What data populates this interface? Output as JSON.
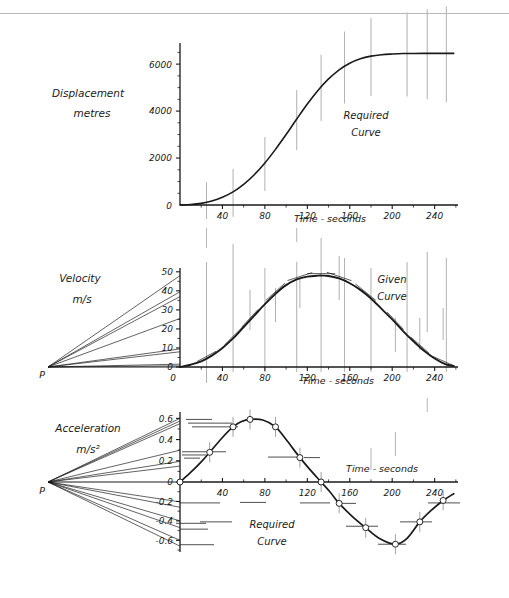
{
  "figure": {
    "background": "#ffffff",
    "ink": "#1a1a1a",
    "construction_color": "#8c8c8c",
    "top_rule": true
  },
  "panels": [
    {
      "id": "displacement",
      "y_axis_title_line1": "Displacement",
      "y_axis_title_line2": "metres",
      "x_axis_title": "Time - seconds",
      "curve_label_line1": "Required",
      "curve_label_line2": "Curve",
      "origin_label": "0",
      "y_ticks": [
        2000,
        4000,
        6000
      ],
      "y_tick_labels": [
        "2000",
        "4000",
        "6000"
      ],
      "x_ticks": [
        40,
        80,
        120,
        160,
        200,
        240
      ],
      "x_tick_labels": [
        "40",
        "80",
        "120",
        "160",
        "200",
        "240"
      ],
      "has_pole": false
    },
    {
      "id": "velocity",
      "y_axis_title_line1": "Velocity",
      "y_axis_title_line2": "m/s",
      "x_axis_title": "Time - seconds",
      "curve_label_line1": "Given",
      "curve_label_line2": "Curve",
      "origin_label": "0",
      "pole_label": "P",
      "y_ticks": [
        0,
        10,
        20,
        30,
        40,
        50
      ],
      "y_tick_labels": [
        "0",
        "10",
        "20",
        "30",
        "40",
        "50"
      ],
      "x_ticks": [
        40,
        80,
        120,
        160,
        200,
        240
      ],
      "x_tick_labels": [
        "40",
        "80",
        "120",
        "160",
        "200",
        "240"
      ],
      "has_pole": true
    },
    {
      "id": "acceleration",
      "y_axis_title_line1": "Acceleration",
      "y_axis_title_line2": "m/s²",
      "x_axis_title": "Time - seconds",
      "curve_label_line1": "Required",
      "curve_label_line2": "Curve",
      "origin_label": "0",
      "pole_label": "P",
      "y_ticks": [
        -0.6,
        -0.4,
        -0.2,
        0,
        0.2,
        0.4,
        0.6
      ],
      "y_tick_labels": [
        "-0.6",
        "-0.4",
        "-0.2",
        "0",
        "0.2",
        "0.4",
        "0.6"
      ],
      "x_ticks": [
        40,
        80,
        120,
        160,
        200,
        240
      ],
      "x_tick_labels": [
        "40",
        "80",
        "120",
        "160",
        "200",
        "240"
      ],
      "has_pole": true
    }
  ],
  "chart_data": [
    {
      "type": "line",
      "id": "displacement",
      "title": "Displacement - Required Curve",
      "xlabel": "Time - seconds",
      "ylabel": "Displacement metres",
      "xlim": [
        0,
        260
      ],
      "ylim": [
        0,
        6800
      ],
      "grid": false,
      "legend": "Required Curve",
      "x": [
        0,
        10,
        20,
        30,
        40,
        50,
        60,
        70,
        80,
        90,
        100,
        110,
        120,
        130,
        140,
        150,
        160,
        170,
        180,
        190,
        200,
        210,
        220,
        230,
        240,
        250,
        258
      ],
      "values": [
        0,
        20,
        70,
        170,
        330,
        560,
        880,
        1290,
        1790,
        2370,
        3000,
        3660,
        4300,
        4880,
        5370,
        5760,
        6040,
        6230,
        6340,
        6400,
        6430,
        6450,
        6455,
        6460,
        6460,
        6460,
        6460
      ],
      "ordinate_lines_at_x": [
        25,
        50,
        80,
        110,
        133,
        155,
        180,
        214,
        233,
        251
      ],
      "ordinate_note": "Vertical construction ordinates drawn through the curve"
    },
    {
      "type": "line",
      "id": "velocity",
      "title": "Velocity - Given Curve",
      "xlabel": "Time - seconds",
      "ylabel": "Velocity m/s",
      "xlim": [
        0,
        260
      ],
      "ylim": [
        0,
        52
      ],
      "grid": false,
      "legend": "Given Curve",
      "x": [
        0,
        10,
        20,
        30,
        40,
        50,
        60,
        70,
        80,
        90,
        100,
        110,
        120,
        130,
        135,
        140,
        150,
        160,
        170,
        180,
        190,
        200,
        210,
        220,
        230,
        240,
        250,
        258
      ],
      "values": [
        0,
        1.2,
        3.0,
        6.0,
        10.0,
        15.0,
        21.0,
        27.0,
        33.0,
        38.5,
        43.0,
        46.0,
        47.5,
        48.0,
        48.0,
        47.8,
        46.5,
        44.0,
        40.5,
        36.0,
        30.5,
        25.0,
        19.0,
        13.5,
        8.5,
        4.5,
        1.5,
        0.5
      ],
      "tangent_points_x": [
        25,
        50,
        66,
        90,
        113,
        133,
        150,
        175,
        203,
        226,
        248
      ],
      "tangent_note": "Short tangent segments drawn at the ordinate stations"
    },
    {
      "type": "line",
      "id": "acceleration",
      "title": "Acceleration - Required Curve",
      "xlabel": "Time - seconds",
      "ylabel": "Acceleration m/s²",
      "xlim": [
        0,
        260
      ],
      "ylim": [
        -0.72,
        0.66
      ],
      "grid": false,
      "legend": "Required Curve",
      "marker": "circle",
      "points": [
        {
          "x": 0,
          "y": 0.0
        },
        {
          "x": 28,
          "y": 0.28
        },
        {
          "x": 50,
          "y": 0.52
        },
        {
          "x": 66,
          "y": 0.59
        },
        {
          "x": 90,
          "y": 0.52
        },
        {
          "x": 113,
          "y": 0.23
        },
        {
          "x": 133,
          "y": 0.0
        },
        {
          "x": 150,
          "y": -0.22
        },
        {
          "x": 175,
          "y": -0.47
        },
        {
          "x": 203,
          "y": -0.64
        },
        {
          "x": 226,
          "y": -0.41
        },
        {
          "x": 248,
          "y": -0.19
        }
      ],
      "x": [
        0,
        10,
        20,
        28,
        40,
        50,
        58,
        66,
        78,
        90,
        100,
        113,
        124,
        133,
        142,
        150,
        162,
        175,
        188,
        203,
        214,
        226,
        237,
        248,
        258
      ],
      "values": [
        0,
        0.09,
        0.19,
        0.28,
        0.42,
        0.52,
        0.57,
        0.59,
        0.585,
        0.52,
        0.4,
        0.23,
        0.1,
        0.0,
        -0.11,
        -0.22,
        -0.35,
        -0.47,
        -0.58,
        -0.64,
        -0.58,
        -0.41,
        -0.29,
        -0.19,
        -0.12
      ]
    }
  ]
}
